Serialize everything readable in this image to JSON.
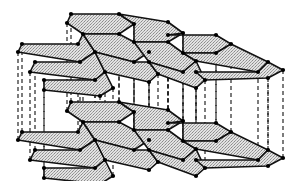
{
  "diagram": {
    "type": "crystal-structure",
    "colors": {
      "background": "#ffffff",
      "sheet_fill": "#d4d4d4",
      "sheet_stroke": "#111111",
      "atom": "#000000",
      "interlayer_bond": "#111111"
    },
    "layer_offset_y": 88,
    "layers": [
      {
        "name": "upper-layer",
        "dy": 0
      },
      {
        "name": "lower-layer",
        "dy": 88
      }
    ],
    "hexagons": [
      [
        [
          71,
          14
        ],
        [
          119,
          14
        ],
        [
          134,
          24
        ],
        [
          119,
          34
        ],
        [
          83,
          34
        ],
        [
          67,
          23
        ]
      ],
      [
        [
          119,
          14
        ],
        [
          168,
          22
        ],
        [
          183,
          33
        ],
        [
          168,
          42
        ],
        [
          134,
          42
        ],
        [
          134,
          24
        ]
      ],
      [
        [
          168,
          35
        ],
        [
          216,
          35
        ],
        [
          231,
          44
        ],
        [
          216,
          53
        ],
        [
          183,
          53
        ],
        [
          183,
          33
        ]
      ],
      [
        [
          22,
          44
        ],
        [
          78,
          44
        ],
        [
          83,
          34
        ],
        [
          95,
          52
        ],
        [
          80,
          62
        ],
        [
          18,
          52
        ]
      ],
      [
        [
          83,
          34
        ],
        [
          119,
          34
        ],
        [
          134,
          42
        ],
        [
          149,
          52
        ],
        [
          134,
          62
        ],
        [
          95,
          52
        ]
      ],
      [
        [
          134,
          42
        ],
        [
          168,
          42
        ],
        [
          183,
          53
        ],
        [
          196,
          61
        ],
        [
          183,
          72
        ],
        [
          149,
          62
        ]
      ],
      [
        [
          183,
          53
        ],
        [
          216,
          53
        ],
        [
          231,
          44
        ],
        [
          268,
          62
        ],
        [
          258,
          72
        ],
        [
          196,
          61
        ]
      ],
      [
        [
          35,
          62
        ],
        [
          80,
          62
        ],
        [
          95,
          52
        ],
        [
          105,
          72
        ],
        [
          95,
          80
        ],
        [
          30,
          72
        ]
      ],
      [
        [
          95,
          52
        ],
        [
          134,
          62
        ],
        [
          149,
          62
        ],
        [
          158,
          74
        ],
        [
          149,
          82
        ],
        [
          105,
          72
        ]
      ],
      [
        [
          149,
          62
        ],
        [
          183,
          72
        ],
        [
          196,
          61
        ],
        [
          205,
          80
        ],
        [
          196,
          88
        ],
        [
          158,
          74
        ]
      ],
      [
        [
          196,
          72
        ],
        [
          258,
          72
        ],
        [
          268,
          62
        ],
        [
          283,
          70
        ],
        [
          268,
          78
        ],
        [
          205,
          80
        ]
      ],
      [
        [
          44,
          80
        ],
        [
          95,
          80
        ],
        [
          105,
          72
        ],
        [
          113,
          88
        ],
        [
          100,
          96
        ],
        [
          44,
          90
        ]
      ]
    ],
    "bonds_x": [
      22,
      30,
      36,
      44,
      58,
      67,
      71,
      80,
      83,
      95,
      105,
      119,
      134,
      149,
      158,
      168,
      183,
      196,
      205,
      216,
      231,
      258,
      268,
      276
    ]
  }
}
